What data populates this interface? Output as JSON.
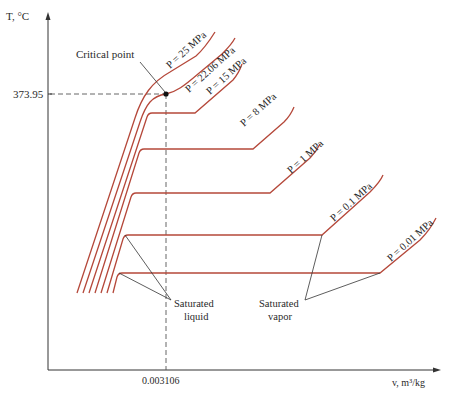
{
  "diagram": {
    "y_axis_label": "T, °C",
    "x_axis_label": "v, m³/kg",
    "critical_point": {
      "label": "Critical point",
      "temperature_label": "373.95",
      "volume_label": "0.003106"
    },
    "isobars": [
      {
        "label": "P = 25 MPa"
      },
      {
        "label": "P = 22.06 MPa"
      },
      {
        "label": "P = 15 MPa"
      },
      {
        "label": "P = 8 MPa"
      },
      {
        "label": "P = 1 MPa"
      },
      {
        "label": "P = 0.1 MPa"
      },
      {
        "label": "P = 0.01 MPa"
      }
    ],
    "annotations": {
      "saturated_liquid": [
        "Saturated",
        "liquid"
      ],
      "saturated_vapor": [
        "Saturated",
        "vapor"
      ]
    },
    "colors": {
      "isobar": "#b5483a",
      "axis": "#333333",
      "text": "#2a2a2a"
    }
  }
}
